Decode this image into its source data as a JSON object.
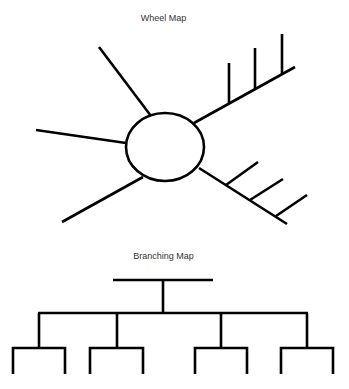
{
  "wheel_map": {
    "title": "Wheel Map"
  },
  "branching_map": {
    "title": "Branching Map"
  },
  "colors": {
    "stroke": "#000000",
    "text": "#333333",
    "background": "#ffffff"
  }
}
